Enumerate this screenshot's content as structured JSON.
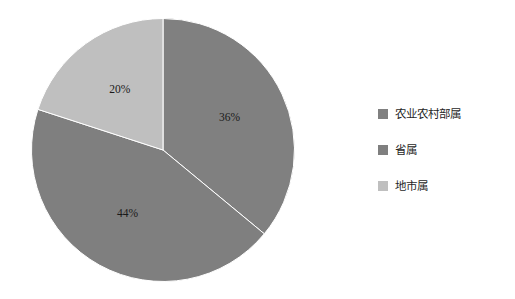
{
  "chart_data": {
    "type": "pie",
    "title": "",
    "subtitle": "",
    "xlabel": "",
    "ylabel": "",
    "categories": [
      "农业农村部属",
      "省属",
      "地市属"
    ],
    "values": [
      36,
      44,
      20
    ],
    "data_labels": [
      "36%",
      "44%",
      "20%"
    ],
    "unit": "%",
    "grid": false,
    "legend_position": "right",
    "start_angle_deg": 0,
    "direction": "clockwise",
    "slices": [
      {
        "name": "农业农村部属",
        "value": 36,
        "label": "36%",
        "color": "#808080",
        "start_angle_deg": 0,
        "end_angle_deg": 129.6
      },
      {
        "name": "省属",
        "value": 44,
        "label": "44%",
        "color": "#7f7f7f",
        "start_angle_deg": 129.6,
        "end_angle_deg": 288.0
      },
      {
        "name": "地市属",
        "value": 20,
        "label": "20%",
        "color": "#bfbfbf",
        "start_angle_deg": 288.0,
        "end_angle_deg": 360.0
      }
    ]
  },
  "legend": {
    "items": [
      {
        "label": "农业农村部属",
        "color": "#808080"
      },
      {
        "label": "省属",
        "color": "#7f7f7f"
      },
      {
        "label": "地市属",
        "color": "#bfbfbf"
      }
    ]
  },
  "colors": {
    "background": "#ffffff",
    "slice_border": "#ffffff",
    "label_text": "#1a1a1a"
  }
}
